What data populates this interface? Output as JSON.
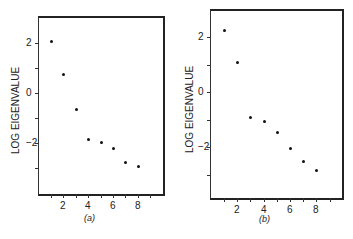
{
  "chart_data": [
    {
      "type": "scatter",
      "title": "",
      "caption": "(a)",
      "xlabel": "",
      "ylabel": "LOG EIGENVALUE",
      "x": [
        1,
        2,
        3,
        4,
        5,
        6,
        7,
        8
      ],
      "y": [
        2.1,
        0.75,
        -0.65,
        -1.85,
        -1.95,
        -2.2,
        -2.75,
        -2.9
      ],
      "xticks": [
        2,
        4,
        6,
        8
      ],
      "yticks": [
        2,
        0,
        -2
      ],
      "xlim": [
        0,
        10
      ],
      "ylim": [
        -4,
        3
      ],
      "grid": false
    },
    {
      "type": "scatter",
      "title": "",
      "caption": "(b)",
      "xlabel": "",
      "ylabel": "LOG EIGENVALUE",
      "x": [
        1,
        2,
        3,
        4,
        5,
        6,
        7,
        8
      ],
      "y": [
        2.25,
        1.1,
        -0.9,
        -1.05,
        -1.45,
        -2.05,
        -2.5,
        -2.85
      ],
      "xticks": [
        2,
        4,
        6,
        8
      ],
      "yticks": [
        2,
        0,
        -2
      ],
      "xlim": [
        0,
        10
      ],
      "ylim": [
        -4,
        3
      ],
      "grid": false
    }
  ],
  "panels": [
    {
      "caption": "(a)",
      "ylabel": "LOG EIGENVALUE",
      "ytick_labels": [
        "2",
        "0",
        "−2"
      ],
      "xtick_labels": [
        "2",
        "4",
        "6",
        "8"
      ]
    },
    {
      "caption": "(b)",
      "ylabel": "LOG EIGENVALUE",
      "ytick_labels": [
        "2",
        "0",
        "−2"
      ],
      "xtick_labels": [
        "2",
        "4",
        "6",
        "8"
      ]
    }
  ]
}
